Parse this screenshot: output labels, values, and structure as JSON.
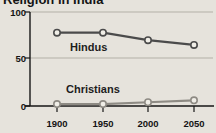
{
  "title": "Religion in India",
  "colors": {
    "background": "#e6e3dc",
    "axis": "#161616",
    "gridline": "#b3b0a7",
    "hindus_line": "#4b4b4b",
    "christians_line": "#8e8b84",
    "marker_fill": "#f0eee7"
  },
  "chart_data": {
    "type": "line",
    "title": "Religion in India",
    "x": [
      1900,
      1950,
      2000,
      2050
    ],
    "x_tick_labels": [
      "1900",
      "1950",
      "2000",
      "2050"
    ],
    "series": [
      {
        "name": "Hindus",
        "values": [
          78,
          78,
          70,
          65
        ],
        "color": "#4b4b4b"
      },
      {
        "name": "Christians",
        "values": [
          2,
          2,
          4,
          6
        ],
        "color": "#8e8b84"
      }
    ],
    "xlabel": "",
    "ylabel": "",
    "units": "percent",
    "ylim": [
      0,
      100
    ],
    "y_ticks": [
      0,
      50,
      100
    ],
    "grid": true,
    "legend_position": "inline-labels",
    "marker": "open-circle"
  }
}
